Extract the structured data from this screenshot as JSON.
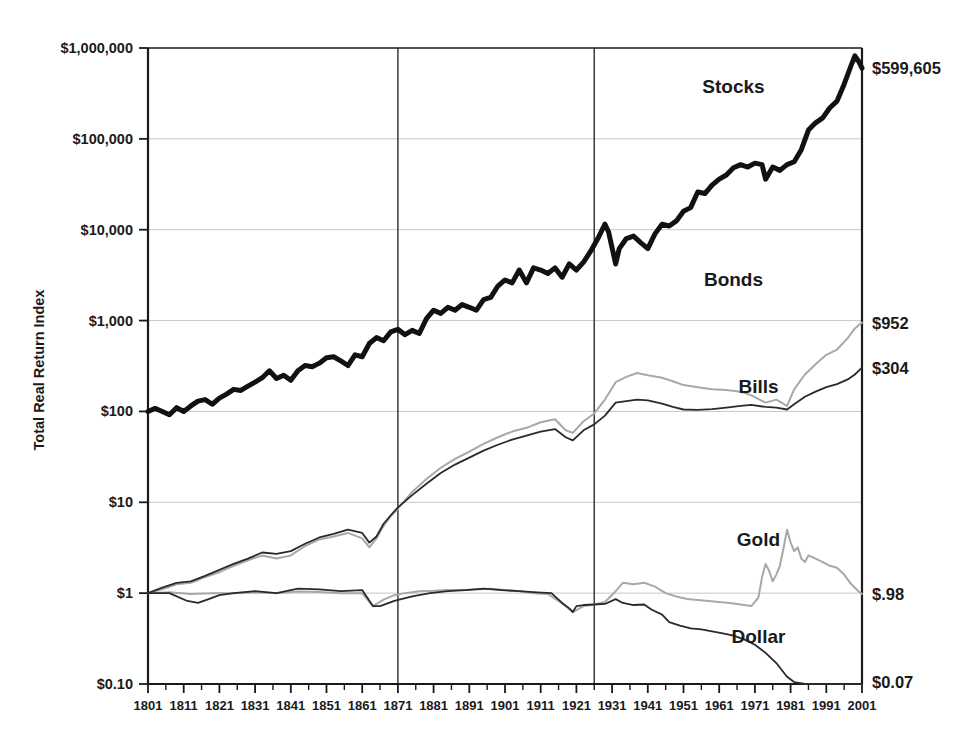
{
  "chart_data": {
    "type": "line",
    "title": "",
    "xlabel": "",
    "ylabel": "Total Real Return Index",
    "yscale": "log",
    "xlim": [
      1801,
      2001
    ],
    "ylim": [
      0.1,
      1000000
    ],
    "grid": true,
    "legend_position": "inline-annotations",
    "y_ticks": [
      {
        "value": 1000000,
        "label": "$1,000,000"
      },
      {
        "value": 100000,
        "label": "$100,000"
      },
      {
        "value": 10000,
        "label": "$10,000"
      },
      {
        "value": 1000,
        "label": "$1,000"
      },
      {
        "value": 100,
        "label": "$100"
      },
      {
        "value": 10,
        "label": "$10"
      },
      {
        "value": 1,
        "label": "$1"
      },
      {
        "value": 0.1,
        "label": "$0.10"
      }
    ],
    "x_ticks": [
      {
        "value": 1801,
        "label": "1801"
      },
      {
        "value": 1811,
        "label": "1811"
      },
      {
        "value": 1821,
        "label": "1821"
      },
      {
        "value": 1831,
        "label": "1831"
      },
      {
        "value": 1841,
        "label": "1841"
      },
      {
        "value": 1851,
        "label": "1851"
      },
      {
        "value": 1861,
        "label": "1861"
      },
      {
        "value": 1871,
        "label": "1871"
      },
      {
        "value": 1881,
        "label": "1881"
      },
      {
        "value": 1891,
        "label": "1891"
      },
      {
        "value": 1901,
        "label": "1901"
      },
      {
        "value": 1911,
        "label": "1911"
      },
      {
        "value": 1921,
        "label": "1921"
      },
      {
        "value": 1931,
        "label": "1931"
      },
      {
        "value": 1941,
        "label": "1941"
      },
      {
        "value": 1951,
        "label": "1951"
      },
      {
        "value": 1961,
        "label": "1961"
      },
      {
        "value": 1971,
        "label": "1971"
      },
      {
        "value": 1981,
        "label": "1981"
      },
      {
        "value": 1991,
        "label": "1991"
      },
      {
        "value": 2001,
        "label": "2001"
      }
    ],
    "period_dividers": [
      {
        "value": 1871,
        "label": ""
      },
      {
        "value": 1926,
        "label": ""
      }
    ],
    "series": [
      {
        "name": "Stocks",
        "label": "Stocks",
        "end_label": "$599,605",
        "end_value": 599605,
        "color": "#111111",
        "width": 5.0,
        "label_x": 1965,
        "label_y": 320000,
        "x": [
          1801,
          1803,
          1805,
          1807,
          1809,
          1811,
          1813,
          1815,
          1817,
          1819,
          1821,
          1823,
          1825,
          1827,
          1829,
          1831,
          1833,
          1835,
          1837,
          1839,
          1841,
          1843,
          1845,
          1847,
          1849,
          1851,
          1853,
          1855,
          1857,
          1859,
          1861,
          1863,
          1865,
          1867,
          1869,
          1871,
          1873,
          1875,
          1877,
          1879,
          1881,
          1883,
          1885,
          1887,
          1889,
          1891,
          1893,
          1895,
          1897,
          1899,
          1901,
          1903,
          1905,
          1907,
          1909,
          1911,
          1913,
          1915,
          1917,
          1919,
          1921,
          1923,
          1925,
          1927,
          1929,
          1930,
          1932,
          1933,
          1935,
          1937,
          1939,
          1941,
          1943,
          1945,
          1947,
          1949,
          1951,
          1953,
          1955,
          1957,
          1959,
          1961,
          1963,
          1965,
          1967,
          1969,
          1971,
          1973,
          1974,
          1976,
          1978,
          1980,
          1982,
          1984,
          1986,
          1988,
          1990,
          1992,
          1994,
          1996,
          1998,
          1999,
          2000,
          2001
        ],
        "y": [
          1.0,
          1.08,
          1.0,
          0.92,
          1.1,
          1.0,
          1.15,
          1.3,
          1.35,
          1.2,
          1.4,
          1.55,
          1.75,
          1.7,
          1.9,
          2.1,
          2.35,
          2.8,
          2.3,
          2.5,
          2.2,
          2.8,
          3.2,
          3.1,
          3.4,
          3.9,
          4.0,
          3.6,
          3.2,
          4.2,
          4.0,
          5.6,
          6.5,
          6.0,
          7.5,
          8.0,
          7.0,
          7.8,
          7.2,
          10.5,
          13.0,
          12.0,
          14.0,
          13.0,
          15.0,
          14.0,
          13.0,
          17.0,
          18.0,
          24.0,
          28.0,
          26.0,
          36.0,
          26.0,
          38.0,
          36.0,
          33.0,
          38.0,
          30.0,
          42.0,
          36.0,
          44.0,
          58.0,
          80.0,
          115.0,
          95.0,
          42.0,
          62.0,
          80.0,
          85.0,
          72.0,
          62.0,
          90.0,
          115.0,
          110.0,
          125.0,
          160.0,
          175.0,
          260.0,
          250.0,
          310.0,
          360.0,
          400.0,
          480.0,
          520.0,
          490.0,
          540.0,
          520.0,
          360.0,
          490.0,
          450.0,
          520.0,
          560.0,
          760.0,
          1250.0,
          1500.0,
          1700.0,
          2200.0,
          2600.0,
          4000.0,
          6500.0,
          8200.0,
          7200.0,
          5996.05
        ],
        "y_scale_factor": 100
      },
      {
        "name": "Bonds",
        "label": "Bonds",
        "end_label": "$952",
        "end_value": 952,
        "color": "#a8a8a8",
        "width": 2.0,
        "label_x": 1965,
        "label_y": 2400,
        "x": [
          1801,
          1805,
          1809,
          1813,
          1817,
          1821,
          1825,
          1829,
          1833,
          1837,
          1841,
          1845,
          1849,
          1853,
          1857,
          1861,
          1863,
          1865,
          1867,
          1869,
          1871,
          1875,
          1879,
          1883,
          1887,
          1891,
          1895,
          1899,
          1903,
          1907,
          1911,
          1915,
          1918,
          1920,
          1923,
          1926,
          1929,
          1932,
          1935,
          1938,
          1941,
          1945,
          1948,
          1951,
          1955,
          1959,
          1963,
          1967,
          1970,
          1974,
          1977,
          1980,
          1982,
          1985,
          1988,
          1991,
          1994,
          1997,
          1999,
          2001
        ],
        "y": [
          1.0,
          1.1,
          1.25,
          1.3,
          1.5,
          1.7,
          2.0,
          2.3,
          2.6,
          2.4,
          2.6,
          3.3,
          3.9,
          4.2,
          4.6,
          4.0,
          3.2,
          4.0,
          5.5,
          7.0,
          8.5,
          13.0,
          18.0,
          24.0,
          30.0,
          36.0,
          44.0,
          52.0,
          60.0,
          66.0,
          76.0,
          82.0,
          62.0,
          58.0,
          78.0,
          95.0,
          135.0,
          210.0,
          240.0,
          265.0,
          250.0,
          235.0,
          215.0,
          195.0,
          185.0,
          175.0,
          172.0,
          165.0,
          150.0,
          125.0,
          135.0,
          115.0,
          175.0,
          255.0,
          330.0,
          420.0,
          480.0,
          640.0,
          820.0,
          952.0
        ]
      },
      {
        "name": "Bills",
        "label": "Bills",
        "end_label": "$304",
        "end_value": 304,
        "color": "#2a2a2a",
        "width": 1.8,
        "label_x": 1972,
        "label_y": 160,
        "x": [
          1801,
          1805,
          1809,
          1813,
          1817,
          1821,
          1825,
          1829,
          1833,
          1837,
          1841,
          1845,
          1849,
          1853,
          1857,
          1861,
          1863,
          1865,
          1867,
          1869,
          1871,
          1875,
          1879,
          1883,
          1887,
          1891,
          1895,
          1899,
          1903,
          1907,
          1911,
          1915,
          1918,
          1920,
          1923,
          1926,
          1929,
          1932,
          1935,
          1938,
          1941,
          1945,
          1948,
          1951,
          1955,
          1959,
          1963,
          1967,
          1970,
          1974,
          1977,
          1980,
          1982,
          1985,
          1988,
          1991,
          1994,
          1997,
          1999,
          2001
        ],
        "y": [
          1.0,
          1.15,
          1.3,
          1.35,
          1.55,
          1.8,
          2.1,
          2.4,
          2.8,
          2.7,
          2.9,
          3.5,
          4.1,
          4.5,
          5.0,
          4.6,
          3.6,
          4.2,
          5.8,
          7.2,
          8.8,
          12.0,
          16.0,
          21.0,
          26.0,
          31.0,
          37.0,
          43.0,
          49.0,
          54.0,
          60.0,
          64.0,
          52.0,
          48.0,
          62.0,
          72.0,
          90.0,
          125.0,
          130.0,
          135.0,
          132.0,
          122.0,
          112.0,
          105.0,
          104.0,
          106.0,
          110.0,
          115.0,
          118.0,
          112.0,
          110.0,
          105.0,
          120.0,
          145.0,
          165.0,
          185.0,
          200.0,
          225.0,
          255.0,
          304.0
        ]
      },
      {
        "name": "Gold",
        "label": "Gold",
        "end_label": "$.98",
        "end_value": 0.98,
        "color": "#a8a8a8",
        "width": 2.0,
        "label_x": 1972,
        "label_y": 3.3,
        "x": [
          1801,
          1807,
          1813,
          1819,
          1825,
          1831,
          1837,
          1843,
          1849,
          1855,
          1861,
          1864,
          1867,
          1870,
          1873,
          1877,
          1881,
          1885,
          1889,
          1893,
          1897,
          1901,
          1905,
          1909,
          1913,
          1916,
          1918,
          1920,
          1923,
          1926,
          1929,
          1932,
          1934,
          1937,
          1940,
          1943,
          1946,
          1949,
          1952,
          1955,
          1958,
          1961,
          1964,
          1967,
          1970,
          1971,
          1972,
          1973,
          1974,
          1975,
          1976,
          1977,
          1978,
          1979,
          1980,
          1981,
          1982,
          1983,
          1984,
          1985,
          1986,
          1988,
          1990,
          1992,
          1994,
          1996,
          1998,
          2000,
          2001
        ],
        "y": [
          1.0,
          1.02,
          0.98,
          1.0,
          1.0,
          1.02,
          1.0,
          1.04,
          1.03,
          1.0,
          1.0,
          0.72,
          0.85,
          0.95,
          1.0,
          1.05,
          1.06,
          1.08,
          1.08,
          1.1,
          1.12,
          1.08,
          1.05,
          1.0,
          0.98,
          0.82,
          0.72,
          0.62,
          0.72,
          0.75,
          0.8,
          1.05,
          1.3,
          1.25,
          1.3,
          1.18,
          1.0,
          0.92,
          0.86,
          0.84,
          0.82,
          0.8,
          0.78,
          0.75,
          0.72,
          0.8,
          0.9,
          1.5,
          2.1,
          1.75,
          1.35,
          1.6,
          2.0,
          3.1,
          5.0,
          3.6,
          2.9,
          3.2,
          2.4,
          2.2,
          2.6,
          2.4,
          2.2,
          2.0,
          1.9,
          1.6,
          1.25,
          1.05,
          0.98
        ]
      },
      {
        "name": "Dollar",
        "label": "Dollar",
        "end_label": "$0.07",
        "end_value": 0.07,
        "color": "#2a2a2a",
        "width": 1.8,
        "label_x": 1972,
        "label_y": 0.28,
        "x": [
          1801,
          1807,
          1812,
          1815,
          1818,
          1821,
          1825,
          1831,
          1837,
          1843,
          1849,
          1855,
          1861,
          1864,
          1866,
          1870,
          1875,
          1880,
          1885,
          1890,
          1895,
          1900,
          1905,
          1910,
          1914,
          1917,
          1919,
          1920,
          1921,
          1923,
          1926,
          1929,
          1932,
          1934,
          1937,
          1940,
          1942,
          1945,
          1947,
          1950,
          1953,
          1956,
          1959,
          1962,
          1965,
          1968,
          1971,
          1974,
          1977,
          1980,
          1982,
          1985,
          1988,
          1991,
          1994,
          1997,
          1999,
          2001
        ],
        "y": [
          1.0,
          1.0,
          0.82,
          0.78,
          0.86,
          0.95,
          1.0,
          1.05,
          1.0,
          1.12,
          1.1,
          1.05,
          1.08,
          0.72,
          0.72,
          0.82,
          0.92,
          1.0,
          1.05,
          1.08,
          1.12,
          1.08,
          1.05,
          1.02,
          1.0,
          0.78,
          0.68,
          0.62,
          0.72,
          0.74,
          0.75,
          0.76,
          0.86,
          0.78,
          0.74,
          0.75,
          0.66,
          0.58,
          0.48,
          0.44,
          0.41,
          0.4,
          0.38,
          0.36,
          0.34,
          0.31,
          0.27,
          0.22,
          0.17,
          0.12,
          0.105,
          0.095,
          0.088,
          0.081,
          0.076,
          0.072,
          0.07,
          0.07
        ]
      }
    ]
  },
  "axis": {
    "y_title": "Total Real Return Index"
  }
}
